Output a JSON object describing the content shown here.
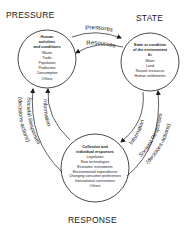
{
  "diagram": {
    "nodes": {
      "pressure": {
        "title": "PRESSURE",
        "heading_lines": [
          "Human",
          "activities",
          "and conditions"
        ],
        "items": [
          "Waste",
          "Trade",
          "Population",
          "Production",
          "Consumption",
          "Others"
        ]
      },
      "state": {
        "title": "STATE",
        "heading_lines": [
          "State or condition",
          "of the environment"
        ],
        "items": [
          "Air",
          "Water",
          "Land",
          "Natural resources",
          "Human settlements"
        ]
      },
      "response": {
        "title": "RESPONSE",
        "heading_lines": [
          "Collective and",
          "individual responses"
        ],
        "items": [
          "Legislation",
          "New technologies",
          "Economic instruments",
          "Environmental expenditures",
          "Changing consumer preferences",
          "International conventions",
          "Others"
        ]
      }
    },
    "edges": {
      "pressures": "Pressures",
      "resources": "Resources",
      "info_left": "Information",
      "info_right": "Information",
      "societal_left_1": "Societal Responses",
      "societal_left_2": "(decisions-actions)",
      "societal_right_1": "Societal Responses",
      "societal_right_2": "(decisions-actions)"
    }
  }
}
